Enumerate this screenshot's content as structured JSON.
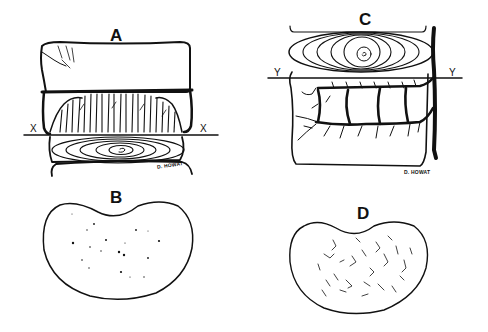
{
  "figure": {
    "panels": [
      {
        "id": "A",
        "label": "A",
        "line_label_left": "X",
        "line_label_right": "X",
        "signature": "D. HOWAT",
        "description": "vertebral body with endplate and vertical vascular channels above intervertebral disc (concentric rings)"
      },
      {
        "id": "B",
        "label": "B",
        "description": "kidney-shaped cross-section with scattered dots"
      },
      {
        "id": "C",
        "label": "C",
        "line_label_left": "Y",
        "line_label_right": "Y",
        "signature": "D. HOWAT",
        "description": "intervertebral disc above vertebral body with branching vessels and large vertical vessel"
      },
      {
        "id": "D",
        "label": "D",
        "description": "kidney-shaped cross-section with scattered short squiggles"
      }
    ],
    "colors": {
      "ink": "#111111",
      "background": "#ffffff"
    }
  }
}
